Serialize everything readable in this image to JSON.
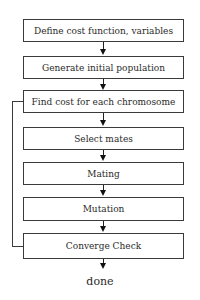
{
  "diagram": {
    "type": "flowchart",
    "steps": [
      {
        "label": "Define cost function, variables"
      },
      {
        "label": "Generate initial population"
      },
      {
        "label": "Find cost for each chromosome"
      },
      {
        "label": "Select mates"
      },
      {
        "label": "Mating"
      },
      {
        "label": "Mutation"
      },
      {
        "label": "Converge Check"
      }
    ],
    "terminal": {
      "label": "done"
    },
    "loop": {
      "from": "Converge Check",
      "to": "Find cost for each chromosome"
    },
    "colors": {
      "line": "#3a3a3a",
      "text": "#2a2a2a",
      "background": "#ffffff"
    }
  }
}
